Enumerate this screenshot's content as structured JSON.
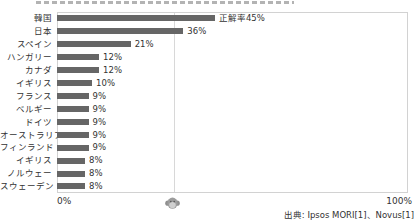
{
  "chart_data": {
    "type": "bar",
    "orientation": "horizontal",
    "categories": [
      "韓国",
      "日本",
      "スペイン",
      "ハンガリー",
      "カナダ",
      "イギリス",
      "フランス",
      "ベルギー",
      "ドイツ",
      "オーストラリア",
      "フィンランド",
      "イギリス",
      "ノルウェー",
      "スウェーデン"
    ],
    "values": [
      45,
      36,
      21,
      12,
      12,
      10,
      9,
      9,
      9,
      9,
      9,
      8,
      8,
      8
    ],
    "value_labels": [
      "正解率45%",
      "36%",
      "21%",
      "12%",
      "12%",
      "10%",
      "9%",
      "9%",
      "9%",
      "9%",
      "9%",
      "8%",
      "8%",
      "8%"
    ],
    "xlim": [
      0,
      100
    ],
    "x_axis_labels": {
      "min": "0%",
      "max": "100%"
    },
    "reference_line_pct": 33.3,
    "grid": "single vertical reference line with marker icon below axis",
    "legend": "none",
    "bar_color": "#666666"
  },
  "footer": {
    "source": "出典: Ipsos MORI[1]、Novus[1]"
  },
  "icons": {
    "reference_marker": "chimp-face-icon"
  },
  "colors": {
    "bar": "#666666",
    "text": "#333333",
    "frame_border": "#d2d2d2",
    "reference_line": "#d8d8d8"
  }
}
